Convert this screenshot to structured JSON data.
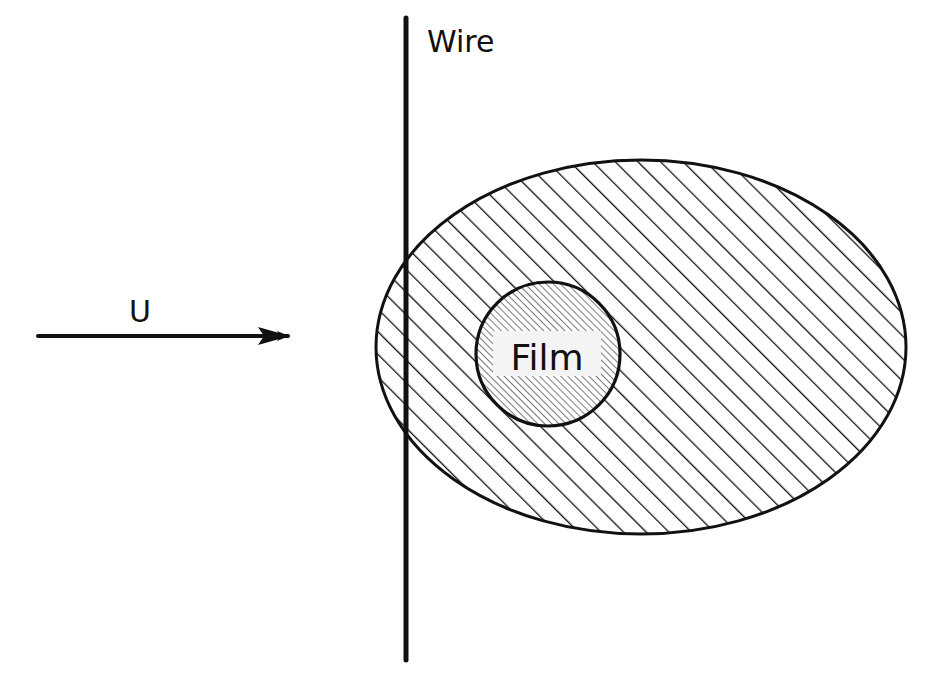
{
  "diagram": {
    "labels": {
      "wire": "Wire",
      "flow": "U",
      "film": "Film"
    },
    "elements": {
      "wire": {
        "x": 406,
        "y_top": 18,
        "y_bottom": 660,
        "stroke_width": 5
      },
      "flow_arrow": {
        "x1": 38,
        "y1": 336,
        "x2": 290,
        "y2": 336,
        "direction": "right"
      },
      "wake_region": {
        "cx": 641,
        "cy": 347,
        "rx": 265,
        "ry": 187,
        "fill": "diagonal-hatch"
      },
      "film_region": {
        "cx": 548,
        "cy": 354,
        "r": 72,
        "fill": "fine-diagonal-hatch"
      }
    },
    "colors": {
      "ink": "#111111",
      "background": "#ffffff",
      "label_box": "#f4f4f4"
    }
  }
}
